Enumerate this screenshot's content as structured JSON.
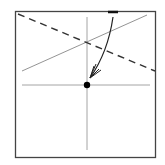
{
  "diagram": {
    "type": "origami-fold-step",
    "colors": {
      "border": "#444444",
      "crease": "#999999",
      "dashed": "#333333",
      "arrow": "#222222",
      "point": "#000000",
      "edge_mark": "#111111",
      "background": "#ffffff"
    },
    "elements": [
      "square paper outline",
      "vertical crease line",
      "horizontal crease line",
      "diagonal crease line",
      "valley fold dashed line",
      "curved fold arrow",
      "reference point",
      "top edge mark"
    ]
  }
}
